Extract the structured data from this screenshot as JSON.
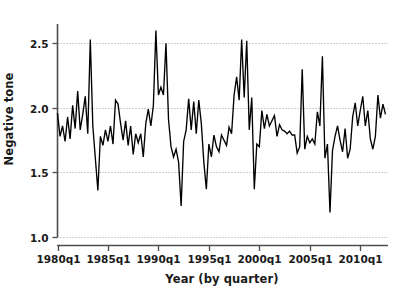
{
  "chart_data": {
    "type": "line",
    "title": "",
    "xlabel": "Year (by quarter)",
    "ylabel": "Negative tone",
    "xlim": [
      1980.0,
      2012.75
    ],
    "ylim": [
      1.0,
      2.65
    ],
    "grid": true,
    "grid_axis": "y",
    "legend": "none",
    "line_color": "#000000",
    "background_color": "#ffffff",
    "ytick_labels": [
      "1.0",
      "1.5",
      "2.0",
      "2.5"
    ],
    "ytick_values": [
      1.0,
      1.5,
      2.0,
      2.5
    ],
    "xtick_labels": [
      "1980q1",
      "1985q1",
      "1990q1",
      "1995q1",
      "2000q1",
      "2005q1",
      "2010q1"
    ],
    "xtick_values": [
      1980.0,
      1985.0,
      1990.0,
      1995.0,
      2000.0,
      2005.0,
      2010.0
    ],
    "series": [
      {
        "name": "Negative tone",
        "x": [
          1980.0,
          1980.25,
          1980.5,
          1980.75,
          1981.0,
          1981.25,
          1981.5,
          1981.75,
          1982.0,
          1982.25,
          1982.5,
          1982.75,
          1983.0,
          1983.25,
          1983.5,
          1983.75,
          1984.0,
          1984.25,
          1984.5,
          1984.75,
          1985.0,
          1985.25,
          1985.5,
          1985.75,
          1986.0,
          1986.25,
          1986.5,
          1986.75,
          1987.0,
          1987.25,
          1987.5,
          1987.75,
          1988.0,
          1988.25,
          1988.5,
          1988.75,
          1989.0,
          1989.25,
          1989.5,
          1989.75,
          1990.0,
          1990.25,
          1990.5,
          1990.75,
          1991.0,
          1991.25,
          1991.5,
          1991.75,
          1992.0,
          1992.25,
          1992.5,
          1992.75,
          1993.0,
          1993.25,
          1993.5,
          1993.75,
          1994.0,
          1994.25,
          1994.5,
          1994.75,
          1995.0,
          1995.25,
          1995.5,
          1995.75,
          1996.0,
          1996.25,
          1996.5,
          1996.75,
          1997.0,
          1997.25,
          1997.5,
          1997.75,
          1998.0,
          1998.25,
          1998.5,
          1998.75,
          1999.0,
          1999.25,
          1999.5,
          1999.75,
          2000.0,
          2000.25,
          2000.5,
          2000.75,
          2001.0,
          2001.25,
          2001.5,
          2001.75,
          2002.0,
          2002.25,
          2002.5,
          2002.75,
          2003.0,
          2003.25,
          2003.5,
          2003.75,
          2004.0,
          2004.25,
          2004.5,
          2004.75,
          2005.0,
          2005.25,
          2005.5,
          2005.75,
          2006.0,
          2006.25,
          2006.5,
          2006.75,
          2007.0,
          2007.25,
          2007.5,
          2007.75,
          2008.0,
          2008.25,
          2008.5,
          2008.75,
          2009.0,
          2009.25,
          2009.5,
          2009.75,
          2010.0,
          2010.25,
          2010.5,
          2010.75,
          2011.0,
          2011.25,
          2011.5,
          2011.75,
          2012.0,
          2012.25,
          2012.5
        ],
        "values": [
          1.96,
          1.78,
          1.86,
          1.74,
          1.93,
          1.76,
          2.02,
          1.84,
          2.13,
          1.83,
          1.95,
          2.09,
          1.8,
          2.53,
          1.86,
          1.61,
          1.36,
          1.78,
          1.71,
          1.83,
          1.74,
          1.86,
          1.72,
          2.06,
          2.03,
          1.88,
          1.75,
          1.9,
          1.71,
          1.86,
          1.64,
          1.8,
          1.73,
          1.8,
          1.62,
          1.88,
          1.99,
          1.86,
          2.02,
          2.6,
          2.1,
          2.16,
          2.1,
          2.5,
          1.91,
          1.7,
          1.62,
          1.68,
          1.58,
          1.24,
          1.74,
          1.83,
          2.07,
          1.83,
          2.05,
          1.8,
          2.06,
          1.88,
          1.58,
          1.37,
          1.72,
          1.62,
          1.79,
          1.7,
          1.66,
          1.79,
          1.75,
          1.71,
          1.85,
          1.8,
          2.1,
          2.24,
          2.06,
          2.53,
          2.08,
          2.52,
          1.83,
          2.08,
          1.37,
          1.72,
          1.7,
          1.98,
          1.84,
          1.95,
          1.86,
          1.9,
          1.94,
          1.78,
          1.87,
          1.83,
          1.82,
          1.8,
          1.82,
          1.79,
          1.79,
          1.65,
          1.7,
          2.3,
          1.68,
          1.78,
          1.73,
          1.76,
          1.72,
          1.97,
          1.86,
          2.4,
          1.61,
          1.72,
          1.19,
          1.67,
          1.78,
          1.86,
          1.75,
          1.66,
          1.84,
          1.61,
          1.68,
          1.93,
          2.04,
          1.86,
          1.98,
          2.09,
          1.86,
          1.98,
          1.76,
          1.68,
          1.78,
          2.1,
          1.92,
          2.03,
          1.95
        ]
      }
    ]
  }
}
